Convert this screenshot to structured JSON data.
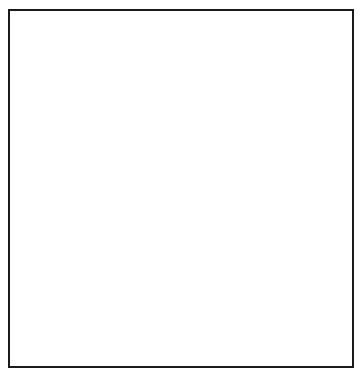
{
  "diagram": {
    "type": "square-packing",
    "frame": {
      "x": 8,
      "y": 9,
      "w": 346,
      "h": 359,
      "border": "#1a1a1a"
    },
    "squares": [
      {
        "id": "A",
        "x": 8,
        "y": 9,
        "w": 94,
        "h": 99,
        "fill": "#d2d2d2"
      },
      {
        "id": "B",
        "x": 101,
        "y": 9,
        "w": 86,
        "h": 89,
        "fill": "#a0a0a0"
      },
      {
        "id": "C",
        "x": 186,
        "y": 9,
        "w": 90,
        "h": 93,
        "fill": "#c2c2c2"
      },
      {
        "id": "D",
        "x": 275,
        "y": 9,
        "w": 79,
        "h": 82,
        "fill": "#e6e6e6"
      },
      {
        "id": "E",
        "x": 8,
        "y": 107,
        "w": 121,
        "h": 124,
        "fill": "#bdbdbd"
      },
      {
        "id": "F",
        "x": 127,
        "y": 96,
        "w": 51,
        "h": 53,
        "fill": "#a8a8a8"
      },
      {
        "id": "G",
        "x": 177,
        "y": 101,
        "w": 45,
        "h": 48,
        "fill": "#b0b0b0"
      },
      {
        "id": "H",
        "x": 221,
        "y": 106,
        "w": 40,
        "h": 43,
        "fill": "#8a8a8a"
      },
      {
        "id": "I",
        "x": 260,
        "y": 101,
        "w": 17,
        "h": 16,
        "fill": "#a4a4a4"
      },
      {
        "id": "J",
        "x": 275,
        "y": 90,
        "w": 26,
        "h": 27,
        "fill": "#9c9c9c"
      },
      {
        "id": "K",
        "x": 260,
        "y": 116,
        "w": 31,
        "h": 33,
        "fill": "#b4b4b4"
      },
      {
        "id": "L",
        "x": 289,
        "y": 116,
        "w": 11,
        "h": 11,
        "fill": "#a6a6a6"
      },
      {
        "id": "M",
        "x": 299,
        "y": 90,
        "w": 55,
        "h": 57,
        "fill": "#adadad"
      },
      {
        "id": "N",
        "x": 133,
        "y": 147,
        "w": 115,
        "h": 117,
        "fill": "#e8e8e8"
      },
      {
        "id": "O",
        "x": 246,
        "y": 146,
        "w": 108,
        "h": 113,
        "fill": "#c0c0c0"
      },
      {
        "id": "P",
        "x": 8,
        "y": 230,
        "w": 66,
        "h": 67,
        "fill": "#e6e6e6"
      },
      {
        "id": "Q",
        "x": 72,
        "y": 229,
        "w": 62,
        "h": 62,
        "fill": "#8c8c8c"
      },
      {
        "id": "R",
        "x": 133,
        "y": 264,
        "w": 21,
        "h": 22,
        "fill": "#a2a2a2"
      },
      {
        "id": "Sm",
        "x": 72,
        "y": 290,
        "w": 7,
        "h": 7,
        "fill": "#8c8c8c"
      },
      {
        "id": "S",
        "x": 8,
        "y": 296,
        "w": 72,
        "h": 72,
        "fill": "#d4d4d4"
      },
      {
        "id": "T",
        "x": 78,
        "y": 290,
        "w": 76,
        "h": 78,
        "fill": "#a6a6a6"
      },
      {
        "id": "U",
        "x": 153,
        "y": 264,
        "w": 100,
        "h": 104,
        "fill": "#a9a9a9"
      },
      {
        "id": "V",
        "x": 251,
        "y": 258,
        "w": 103,
        "h": 110,
        "fill": "#d2d2d2"
      }
    ]
  }
}
